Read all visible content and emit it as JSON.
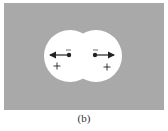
{
  "figure": {
    "caption": "(b)",
    "background_color": "#a9a9a9",
    "region_color": "#ffffff",
    "ink_color": "#222222",
    "lobes": [
      {
        "name": "left",
        "cx": 70,
        "cy": 56,
        "r": 26
      },
      {
        "name": "right",
        "cx": 96,
        "cy": 56,
        "r": 26
      }
    ],
    "charges": [
      {
        "name": "left-electron",
        "sign": "−",
        "x": 69,
        "y": 55,
        "arrow_direction": "left"
      },
      {
        "name": "right-electron",
        "sign": "−",
        "x": 95,
        "y": 55,
        "arrow_direction": "right"
      }
    ],
    "nuclei": [
      {
        "name": "left-nucleus",
        "sign": "+",
        "x": 57,
        "y": 66
      },
      {
        "name": "right-nucleus",
        "sign": "+",
        "x": 107,
        "y": 67
      }
    ]
  }
}
